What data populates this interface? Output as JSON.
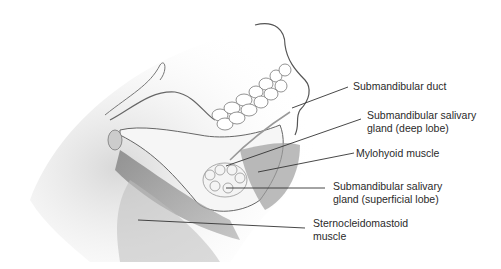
{
  "figure": {
    "labels": [
      {
        "id": "submandibular-duct",
        "line1": "Submandibular duct",
        "line2": ""
      },
      {
        "id": "deep-lobe",
        "line1": "Submandibular salivary",
        "line2": "gland (deep lobe)"
      },
      {
        "id": "mylohyoid",
        "line1": "Mylohyoid muscle",
        "line2": ""
      },
      {
        "id": "superficial-lobe",
        "line1": "Submandibular salivary",
        "line2": "gland (superficial lobe)"
      },
      {
        "id": "sternocleidomastoid",
        "line1": "Sternocleidomastoid",
        "line2": "muscle"
      }
    ]
  }
}
